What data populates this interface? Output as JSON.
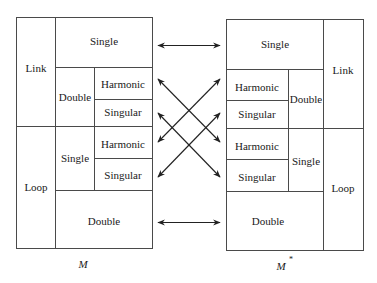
{
  "diagram": {
    "type": "mapping-diagram",
    "left_panel": {
      "caption": "M",
      "sections": {
        "link": {
          "label": "Link",
          "single": "Single",
          "double": {
            "label": "Double",
            "harmonic": "Harmonic",
            "singular": "Singular"
          }
        },
        "loop": {
          "label": "Loop",
          "single": {
            "label": "Single",
            "harmonic": "Harmonic",
            "singular": "Singular"
          },
          "double": "Double"
        }
      }
    },
    "right_panel": {
      "caption": "M",
      "caption_superscript": "*",
      "sections": {
        "link": {
          "label": "Link",
          "single": "Single",
          "double": {
            "label": "Double",
            "harmonic": "Harmonic",
            "singular": "Singular"
          }
        },
        "loop": {
          "label": "Loop",
          "single": {
            "label": "Single",
            "harmonic": "Harmonic",
            "singular": "Singular"
          },
          "double": "Double"
        }
      }
    },
    "correspondences": [
      {
        "from": "M Link Single",
        "to": "M* Link Single",
        "direction": "bidirectional"
      },
      {
        "from": "M Link Double Harmonic",
        "to": "M* Loop Single Harmonic",
        "direction": "bidirectional"
      },
      {
        "from": "M Link Double Singular",
        "to": "M* Loop Single Singular",
        "direction": "bidirectional"
      },
      {
        "from": "M Loop Single Harmonic",
        "to": "M* Link Double Harmonic",
        "direction": "bidirectional"
      },
      {
        "from": "M Loop Single Singular",
        "to": "M* Link Double Singular",
        "direction": "bidirectional"
      },
      {
        "from": "M Loop Double",
        "to": "M* Loop Double",
        "direction": "bidirectional"
      }
    ]
  }
}
